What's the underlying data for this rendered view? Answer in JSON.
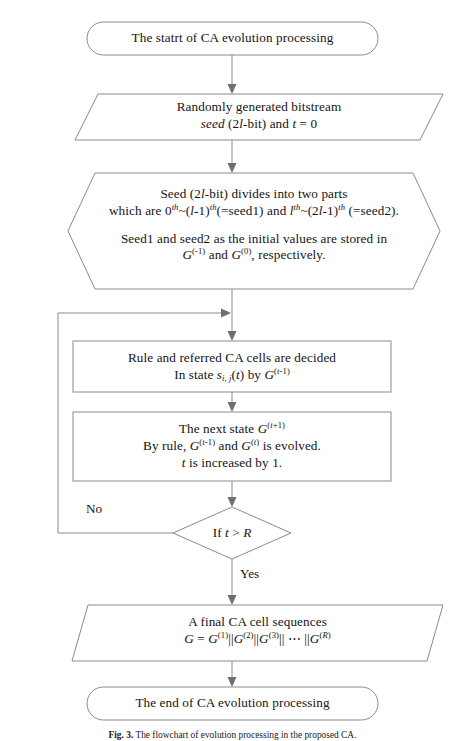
{
  "figure": {
    "caption_label": "Fig. 3.",
    "caption_text": "The flowchart of evolution processing in the proposed CA.",
    "stroke_color": "#8a8a8a",
    "text_color": "#141414",
    "background": "#ffffff"
  },
  "nodes": {
    "start": {
      "shape": "terminator",
      "text": "The statrt of CA evolution processing"
    },
    "random_seed": {
      "shape": "parallelogram",
      "line1": "Randomly generated bitstream",
      "line2_a": "seed",
      "line2_b": " (2",
      "line2_c": "l",
      "line2_d": "-bit) and ",
      "line2_e": "t",
      "line2_f": " = 0"
    },
    "seed_split": {
      "shape": "hexagon",
      "line1": "Seed (2l-bit) divides into two parts",
      "line2": "which are 0th~(l-1)th(=seed1) and lth~(2l-1)th (=seed2).",
      "line3": "Seed1 and seed2 as the initial values are stored in",
      "line4": "G(-1) and G(0), respectively."
    },
    "rule_decided": {
      "shape": "process",
      "line1": "Rule and referred CA cells are decided",
      "line2": "In state si, j(t) by G(t-1)"
    },
    "next_state": {
      "shape": "process",
      "line1": "The next state G(t+1)",
      "line2": "By rule, G(t-1) and G(t) is evolved.",
      "line3": "t is increased by 1."
    },
    "decision": {
      "shape": "diamond",
      "text": "If t > R",
      "label_no": "No",
      "label_yes": "Yes"
    },
    "final_sequence": {
      "shape": "parallelogram",
      "line1": "A final CA cell sequences",
      "line2": "G = G(1)||G(2)||G(3)|| ⋯ ||G(R)"
    },
    "end": {
      "shape": "terminator",
      "text": "The end of CA evolution processing"
    }
  }
}
